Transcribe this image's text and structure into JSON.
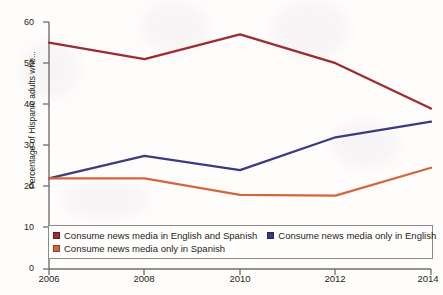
{
  "chart_data": {
    "type": "line",
    "title": "",
    "xlabel": "",
    "ylabel": "Percentage of Hispanic adults who...",
    "x": [
      2006,
      2008,
      2010,
      2012,
      2014
    ],
    "xticklabels": [
      "2006",
      "2008",
      "2010",
      "2012",
      "2014"
    ],
    "ylim": [
      0,
      60
    ],
    "yticks": [
      0,
      10,
      20,
      30,
      40,
      50,
      60
    ],
    "yticklabels": [
      "0",
      "10",
      "20",
      "30",
      "40",
      "50",
      "60"
    ],
    "grid": false,
    "legend_position": "bottom-inside",
    "series": [
      {
        "name": "Consume news media in English and Spanish",
        "color": "#9e2b31",
        "values": [
          55,
          51,
          57,
          50,
          39
        ]
      },
      {
        "name": "Consume news media only in English",
        "color": "#3b3b82",
        "values": [
          22,
          27.5,
          24,
          32,
          35.8
        ]
      },
      {
        "name": "Consume news media only in Spanish",
        "color": "#d4663f",
        "values": [
          22,
          22,
          18,
          17.8,
          24.6
        ]
      }
    ]
  },
  "axis": {
    "y_label": "Percentage of Hispanic adults who...",
    "y_ticks": [
      "60",
      "50",
      "40",
      "30",
      "20",
      "10",
      "0"
    ],
    "x_ticks": [
      "2006",
      "2008",
      "2010",
      "2012",
      "2014"
    ]
  },
  "legend": {
    "items": [
      {
        "label": "Consume news media in English and Spanish",
        "color": "#9e2b31"
      },
      {
        "label": "Consume news media only in English",
        "color": "#3b3b82"
      },
      {
        "label": "Consume news media only in Spanish",
        "color": "#d4663f"
      }
    ]
  }
}
